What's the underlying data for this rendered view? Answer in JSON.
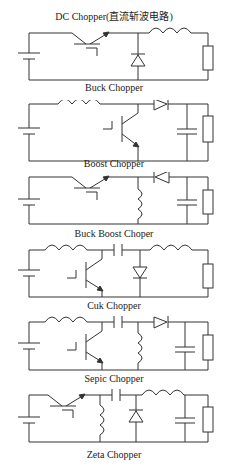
{
  "title": "DC Chopper(直流斩波电路)",
  "circuits": [
    {
      "name": "Buck Chopper"
    },
    {
      "name": "Boost Chopper"
    },
    {
      "name": "Buck Boost Choper"
    },
    {
      "name": "Cuk Chopper"
    },
    {
      "name": "Sepic Chopper"
    },
    {
      "name": "Zeta Chopper"
    }
  ],
  "components": {
    "source": "dc-voltage-source",
    "switch": "transistor",
    "inductor": "inductor",
    "diode": "diode",
    "capacitor": "capacitor",
    "load": "resistor"
  },
  "colors": {
    "line": "#333333",
    "background": "#ffffff",
    "text": "#222222"
  }
}
